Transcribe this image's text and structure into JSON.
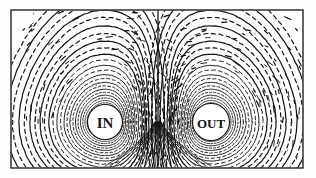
{
  "figure": {
    "style": "vintage engraving line drawing",
    "background_color": "#fefefe",
    "ink_color": "#111111",
    "frame": {
      "name": "rectangular border frame",
      "x": 11,
      "y": 10,
      "width": 292,
      "height": 158,
      "stroke_width": 1.3
    },
    "conductors": [
      {
        "id": "left",
        "label": "IN",
        "description": "current flowing into the page",
        "center_x": 105,
        "center_y": 122,
        "core_radius": 17.5
      },
      {
        "id": "right",
        "label": "OUT",
        "description": "current flowing out of the page",
        "center_x": 211,
        "center_y": 122,
        "core_radius": 18.5
      }
    ],
    "neutral_line": {
      "name": "central neutral plane",
      "x": 158,
      "y_top": 10,
      "y_bottom": 168
    },
    "legend": {
      "solid": "lines of force",
      "dashed": "equipotential lines"
    }
  },
  "chart_data": {
    "type": "line",
    "xlabel": "",
    "ylabel": "",
    "xlim": [
      11,
      303
    ],
    "ylim": [
      10,
      168
    ],
    "grid": false,
    "legend_position": "none",
    "annotations": [
      "IN",
      "OUT"
    ],
    "series": [
      {
        "name": "solid-field-rings-left",
        "style": "solid",
        "center": [
          105,
          122
        ],
        "radii": [
          6.5,
          9.5,
          12.5,
          16,
          20,
          24.5,
          29.5,
          35,
          41,
          48,
          56,
          65,
          75,
          86,
          99
        ]
      },
      {
        "name": "dashed-equipotential-rings-left",
        "style": "dashed",
        "center": [
          105,
          122
        ],
        "radii": [
          8,
          11,
          14.2,
          18,
          22.2,
          27,
          32.2,
          38,
          44.5,
          52,
          60.5,
          70,
          80.5,
          92.5,
          106
        ]
      },
      {
        "name": "solid-field-rings-right",
        "style": "solid",
        "center": [
          211,
          122
        ],
        "radii": [
          6.5,
          9.5,
          12.5,
          16,
          20,
          24.5,
          29.5,
          35,
          41,
          48,
          56,
          65,
          75,
          86,
          99
        ]
      },
      {
        "name": "dashed-equipotential-rings-right",
        "style": "dashed",
        "center": [
          211,
          122
        ],
        "radii": [
          8,
          11,
          14.2,
          18,
          22.2,
          27,
          32.2,
          38,
          44.5,
          52,
          60.5,
          70,
          80.5,
          92.5,
          106
        ]
      },
      {
        "name": "neutral-plane",
        "style": "solid",
        "points": [
          [
            158,
            10
          ],
          [
            158,
            168
          ]
        ]
      }
    ]
  }
}
